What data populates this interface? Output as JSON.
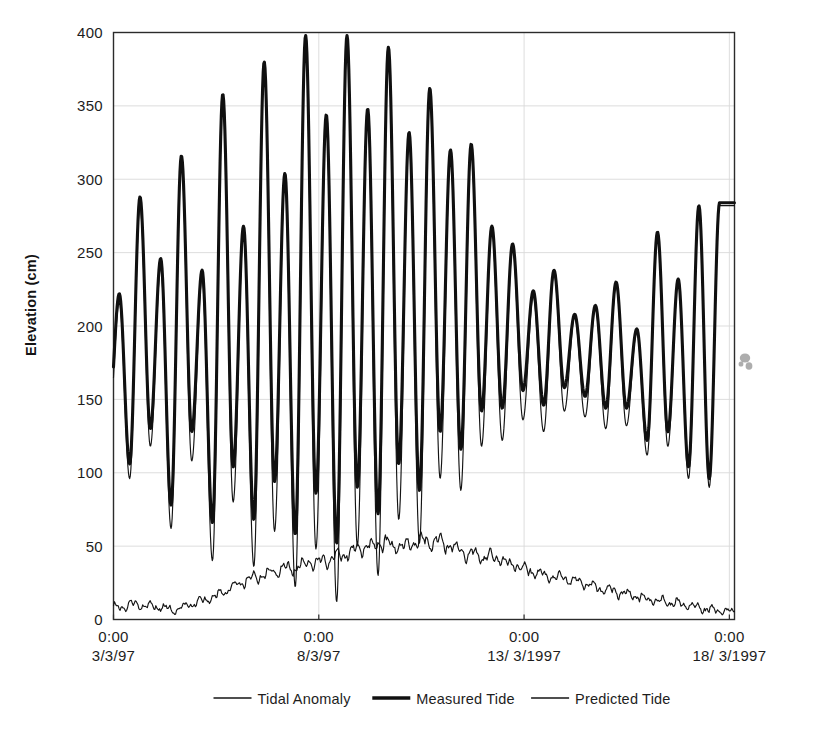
{
  "chart_data": {
    "type": "line",
    "title": "",
    "xlabel": "",
    "ylabel": "Elevation (cm)",
    "ylim": [
      0,
      400
    ],
    "yticks": [
      0,
      50,
      100,
      150,
      200,
      250,
      300,
      350,
      400
    ],
    "ytick_labels": [
      "0",
      "50",
      "100",
      "150",
      "200",
      "250",
      "300",
      "350",
      "400"
    ],
    "xtick_labels": [
      {
        "time": "0:00",
        "date": "3/3/97"
      },
      {
        "time": "0:00",
        "date": "8/3/97"
      },
      {
        "time": "0:00",
        "date": "13/ 3/1997"
      },
      {
        "time": "0:00",
        "date": "18/ 3/1997"
      }
    ],
    "xtick_hours": [
      0,
      120,
      240,
      360
    ],
    "xlim_hours": [
      0,
      363
    ],
    "grid": "both-faint",
    "legend_position": "below",
    "legend": [
      "Tidal Anomaly",
      "Measured Tide",
      "Predicted Tide"
    ],
    "series": [
      {
        "name": "Predicted Tide",
        "style": "thin",
        "sample_interval_hours": 0.5,
        "note": "Semi-diurnal tide, spring around 8/3/97 reaching ~398 cm, neap around 14-15/3/97",
        "peaks_cm": [
          216,
          282,
          240,
          313,
          232,
          356,
          264,
          378,
          300,
          396,
          340,
          398,
          346,
          388,
          330,
          360,
          318,
          322,
          266,
          254,
          220,
          236,
          206,
          212,
          228,
          196,
          262,
          230,
          280,
          282
        ],
        "troughs_cm": [
          130,
          96,
          118,
          62,
          108,
          40,
          80,
          36,
          60,
          22,
          48,
          12,
          50,
          30,
          68,
          52,
          96,
          88,
          118,
          122,
          136,
          128,
          142,
          138,
          130,
          132,
          112,
          118,
          96,
          90
        ]
      },
      {
        "name": "Measured Tide",
        "style": "thick",
        "sample_interval_hours": 0.5,
        "note": "Predicted tide plus tidal anomaly offset; peaks slightly above predicted, troughs substantially above predicted",
        "peaks_cm": [
          222,
          288,
          246,
          316,
          238,
          358,
          268,
          380,
          304,
          398,
          344,
          398,
          348,
          390,
          332,
          362,
          320,
          324,
          268,
          256,
          224,
          238,
          208,
          214,
          230,
          198,
          264,
          232,
          282,
          284
        ],
        "troughs_cm": [
          138,
          106,
          130,
          78,
          128,
          66,
          104,
          68,
          94,
          58,
          86,
          52,
          90,
          72,
          106,
          88,
          128,
          116,
          142,
          144,
          156,
          146,
          158,
          152,
          144,
          144,
          122,
          128,
          104,
          96
        ]
      },
      {
        "name": "Tidal Anomaly",
        "style": "thin",
        "sample_interval_hours": 0.5,
        "note": "Noisy low-amplitude residual; rises from ~8 cm to a broad maximum of ~55 cm near 9-10/3/97, then decays to ~4 cm by 18/3/97",
        "envelope_points": [
          {
            "hours": 0,
            "cm": 8
          },
          {
            "hours": 12,
            "cm": 10
          },
          {
            "hours": 24,
            "cm": 9
          },
          {
            "hours": 36,
            "cm": 6
          },
          {
            "hours": 48,
            "cm": 12
          },
          {
            "hours": 60,
            "cm": 16
          },
          {
            "hours": 72,
            "cm": 24
          },
          {
            "hours": 84,
            "cm": 30
          },
          {
            "hours": 96,
            "cm": 34
          },
          {
            "hours": 108,
            "cm": 36
          },
          {
            "hours": 120,
            "cm": 40
          },
          {
            "hours": 132,
            "cm": 44
          },
          {
            "hours": 144,
            "cm": 48
          },
          {
            "hours": 156,
            "cm": 52
          },
          {
            "hours": 168,
            "cm": 50
          },
          {
            "hours": 180,
            "cm": 54
          },
          {
            "hours": 192,
            "cm": 52
          },
          {
            "hours": 204,
            "cm": 46
          },
          {
            "hours": 216,
            "cm": 44
          },
          {
            "hours": 228,
            "cm": 40
          },
          {
            "hours": 240,
            "cm": 34
          },
          {
            "hours": 252,
            "cm": 30
          },
          {
            "hours": 264,
            "cm": 28
          },
          {
            "hours": 276,
            "cm": 24
          },
          {
            "hours": 288,
            "cm": 20
          },
          {
            "hours": 300,
            "cm": 17
          },
          {
            "hours": 312,
            "cm": 14
          },
          {
            "hours": 324,
            "cm": 12
          },
          {
            "hours": 336,
            "cm": 10
          },
          {
            "hours": 348,
            "cm": 7
          },
          {
            "hours": 363,
            "cm": 5
          }
        ]
      }
    ]
  },
  "colors": {
    "ink": "#141414",
    "measured": "#101010",
    "grid": "#d9d9d9",
    "frame": "#2b2b2b",
    "background": "#ffffff"
  },
  "artifacts": {
    "smudge_label": "scan-smudge"
  }
}
